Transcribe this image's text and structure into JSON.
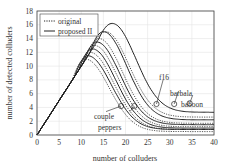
{
  "chart_data": {
    "type": "line",
    "title": "",
    "xlabel": "number of colluders",
    "ylabel": "number of detected colluders",
    "xlim": [
      0,
      40
    ],
    "ylim": [
      0,
      18
    ],
    "xticks": [
      0,
      5,
      10,
      15,
      20,
      25,
      30,
      35,
      40
    ],
    "yticks": [
      0,
      2,
      4,
      6,
      8,
      10,
      12,
      14,
      16,
      18
    ],
    "grid": true,
    "legend": {
      "position": "upper left",
      "entries": [
        {
          "label": "original",
          "style": "dotted"
        },
        {
          "label": "proposed II",
          "style": "solid"
        }
      ]
    },
    "annotations": [
      "couple",
      "peppers",
      "f16",
      "barbala",
      "baboon"
    ],
    "series": [
      {
        "name": "original - couple",
        "style": "dotted",
        "peak": [
          11,
          11
        ],
        "end": 0.5
      },
      {
        "name": "proposed II - couple",
        "style": "solid",
        "peak": [
          11.5,
          11.5
        ],
        "end": 0.8
      },
      {
        "name": "original - peppers",
        "style": "dotted",
        "peak": [
          12,
          12
        ],
        "end": 0.8
      },
      {
        "name": "proposed II - peppers",
        "style": "solid",
        "peak": [
          12.5,
          12.5
        ],
        "end": 1.0
      },
      {
        "name": "original - f16",
        "style": "dotted",
        "peak": [
          13,
          13
        ],
        "end": 1.2
      },
      {
        "name": "proposed II - f16",
        "style": "solid",
        "peak": [
          13.5,
          13.5
        ],
        "end": 1.5
      },
      {
        "name": "original - barbala",
        "style": "dotted",
        "peak": [
          14,
          14
        ],
        "end": 1.7
      },
      {
        "name": "proposed II - barbala",
        "style": "solid",
        "peak": [
          15,
          15
        ],
        "end": 2.2
      },
      {
        "name": "original - baboon",
        "style": "dotted",
        "peak": [
          15.5,
          15
        ],
        "end": 2.6
      },
      {
        "name": "proposed II - baboon",
        "style": "solid",
        "peak": [
          17,
          16.2
        ],
        "end": 3.3
      }
    ]
  }
}
